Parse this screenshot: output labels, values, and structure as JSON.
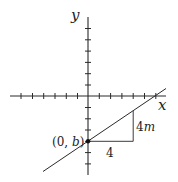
{
  "diagram": {
    "title": "",
    "axes": {
      "x_label": "x",
      "y_label": "y",
      "x_ticks_left": 6,
      "x_ticks_right": 6,
      "y_ticks_above": 6,
      "y_ticks_below": 6
    },
    "point": {
      "label": "(0, b)",
      "label_parts": [
        "(0, ",
        "b",
        ")"
      ]
    },
    "slope_triangle": {
      "run_label": "4",
      "rise_label_number": "4",
      "rise_label_var": "m"
    },
    "colors": {
      "stroke": "#2a2a2a",
      "background": "#ffffff"
    }
  }
}
